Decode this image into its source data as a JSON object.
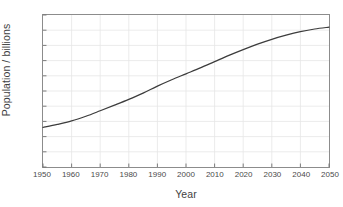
{
  "chart_data": {
    "type": "line",
    "title": "",
    "xlabel": "Year",
    "ylabel": "Population / billions",
    "xlim": [
      1950,
      2050
    ],
    "ylim": [
      0,
      10
    ],
    "grid": true,
    "legend": "none",
    "xticks": [
      "1950",
      "1960",
      "1970",
      "1980",
      "1990",
      "2000",
      "2010",
      "2020",
      "2030",
      "2040",
      "2050"
    ],
    "xtick_values": [
      1950,
      1960,
      1970,
      1980,
      1990,
      2000,
      2010,
      2020,
      2030,
      2040,
      2050
    ],
    "yticks": [
      "0",
      "1",
      "2",
      "3",
      "4",
      "5",
      "6",
      "7",
      "8",
      "9",
      "10"
    ],
    "ytick_values": [
      0,
      1,
      2,
      3,
      4,
      5,
      6,
      7,
      8,
      9,
      10
    ],
    "series": [
      {
        "name": "World population",
        "color": "#3c3c3c",
        "x": [
          1950,
          1955,
          1960,
          1965,
          1970,
          1975,
          1980,
          1985,
          1990,
          1995,
          2000,
          2005,
          2010,
          2015,
          2020,
          2025,
          2030,
          2035,
          2040,
          2045,
          2050
        ],
        "values": [
          2.6,
          2.8,
          3.03,
          3.34,
          3.7,
          4.07,
          4.45,
          4.86,
          5.32,
          5.74,
          6.13,
          6.52,
          6.93,
          7.34,
          7.72,
          8.08,
          8.4,
          8.67,
          8.9,
          9.08,
          9.2
        ]
      }
    ]
  },
  "axes": {
    "y_title": "Population / billions",
    "x_title": "Year"
  }
}
